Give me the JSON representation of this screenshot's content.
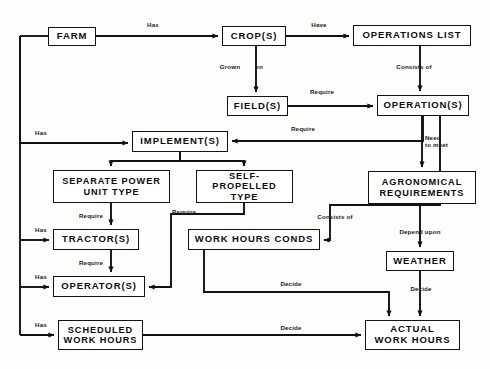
{
  "diagram": {
    "stroke_color": "#121212",
    "background_color": "#fdfdfc",
    "nodes": [
      {
        "id": "farm",
        "label": "FARM",
        "x": 48,
        "y": 27,
        "w": 48,
        "h": 19,
        "font": 9.5
      },
      {
        "id": "crops",
        "label": "CROP(S)",
        "x": 222,
        "y": 26,
        "w": 64,
        "h": 20,
        "font": 9.5
      },
      {
        "id": "oplist",
        "label": "OPERATIONS LIST",
        "x": 353,
        "y": 25,
        "w": 118,
        "h": 21,
        "font": 9.5
      },
      {
        "id": "fields",
        "label": "FIELD(S)",
        "x": 227,
        "y": 96,
        "w": 61,
        "h": 20,
        "font": 9.5
      },
      {
        "id": "operations",
        "label": "OPERATION(S)",
        "x": 377,
        "y": 95,
        "w": 92,
        "h": 21,
        "font": 9.5
      },
      {
        "id": "implements",
        "label": "IMPLEMENT(S)",
        "x": 132,
        "y": 131,
        "w": 96,
        "h": 21,
        "font": 9.5
      },
      {
        "id": "separate",
        "label": "SEPARATE POWER\nUNIT TYPE",
        "x": 53,
        "y": 170,
        "w": 117,
        "h": 33,
        "font": 9.2
      },
      {
        "id": "selfprop",
        "label": "SELF-PROPELLED\nTYPE",
        "x": 196,
        "y": 170,
        "w": 97,
        "h": 33,
        "font": 9.2
      },
      {
        "id": "agronomical",
        "label": "AGRONOMICAL\nREQUIREMENTS",
        "x": 368,
        "y": 171,
        "w": 108,
        "h": 33,
        "font": 9.2
      },
      {
        "id": "tractors",
        "label": "TRACTOR(S)",
        "x": 53,
        "y": 229,
        "w": 86,
        "h": 21,
        "font": 9.5
      },
      {
        "id": "workcond",
        "label": "WORK HOURS CONDS",
        "x": 188,
        "y": 229,
        "w": 132,
        "h": 21,
        "font": 9.5
      },
      {
        "id": "weather",
        "label": "WEATHER",
        "x": 386,
        "y": 251,
        "w": 68,
        "h": 20,
        "font": 9.5
      },
      {
        "id": "operators",
        "label": "OPERATOR(S)",
        "x": 53,
        "y": 276,
        "w": 92,
        "h": 21,
        "font": 9.5
      },
      {
        "id": "scheduled",
        "label": "SCHEDULED\nWORK HOURS",
        "x": 58,
        "y": 320,
        "w": 85,
        "h": 30,
        "font": 9.2
      },
      {
        "id": "actual",
        "label": "ACTUAL\nWORK HOURS",
        "x": 365,
        "y": 320,
        "w": 95,
        "h": 30,
        "font": 9.5
      }
    ],
    "edges": [
      {
        "id": "farm-crops",
        "from": "FARM",
        "to": "CROP(S)",
        "label": "Has"
      },
      {
        "id": "crops-oplist",
        "from": "CROP(S)",
        "to": "OPERATIONS LIST",
        "label": "Have"
      },
      {
        "id": "crops-fields",
        "from": "CROP(S)",
        "to": "FIELD(S)",
        "label": "Grown  on"
      },
      {
        "id": "oplist-operations",
        "from": "OPERATIONS LIST",
        "to": "OPERATION(S)",
        "label": "Consists of"
      },
      {
        "id": "fields-operations",
        "from": "FIELD(S)",
        "to": "OPERATION(S)",
        "label": "Require"
      },
      {
        "id": "operations-implements",
        "from": "OPERATION(S)",
        "to": "IMPLEMENT(S)",
        "label": "Require"
      },
      {
        "id": "farm-implements",
        "from": "FARM",
        "to": "IMPLEMENT(S)",
        "label": "Has"
      },
      {
        "id": "operations-agronomical",
        "from": "OPERATION(S)",
        "to": "AGRONOMICAL REQUIREMENTS",
        "label": "Need\nto meet"
      },
      {
        "id": "separate-tractors",
        "from": "SEPARATE POWER UNIT TYPE",
        "to": "TRACTOR(S)",
        "label": "Require"
      },
      {
        "id": "selfprop-operators",
        "from": "SELF-PROPELLED TYPE",
        "to": "OPERATOR(S)",
        "label": "Require"
      },
      {
        "id": "farm-tractors",
        "from": "FARM",
        "to": "TRACTOR(S)",
        "label": "Has"
      },
      {
        "id": "tractors-operators",
        "from": "TRACTOR(S)",
        "to": "OPERATOR(S)",
        "label": "Require"
      },
      {
        "id": "farm-operators",
        "from": "FARM",
        "to": "OPERATOR(S)",
        "label": "Has"
      },
      {
        "id": "operations-workcond",
        "from": "OPERATION(S)",
        "to": "WORK HOURS CONDS",
        "label": "Consists of"
      },
      {
        "id": "agronomical-weather",
        "from": "AGRONOMICAL REQUIREMENTS",
        "to": "WEATHER",
        "label": "Depend upon"
      },
      {
        "id": "weather-actual",
        "from": "WEATHER",
        "to": "ACTUAL WORK HOURS",
        "label": "Decide"
      },
      {
        "id": "workcond-actual",
        "from": "WORK HOURS CONDS",
        "to": "ACTUAL WORK HOURS",
        "label": "Decide"
      },
      {
        "id": "farm-scheduled",
        "from": "FARM",
        "to": "SCHEDULED WORK HOURS",
        "label": "Has"
      },
      {
        "id": "scheduled-actual",
        "from": "SCHEDULED WORK HOURS",
        "to": "ACTUAL WORK HOURS",
        "label": "Decide"
      }
    ],
    "edge_labels": [
      {
        "id": "lbl-has-crops",
        "text": "Has",
        "x": 141,
        "y": 21,
        "w": 24
      },
      {
        "id": "lbl-have",
        "text": "Have",
        "x": 306,
        "y": 21,
        "w": 26
      },
      {
        "id": "lbl-grown",
        "text": "Grown",
        "x": 216,
        "y": 63,
        "w": 28
      },
      {
        "id": "lbl-on",
        "text": "on",
        "x": 251,
        "y": 63,
        "w": 16
      },
      {
        "id": "lbl-consists-top",
        "text": "Consists of",
        "x": 392,
        "y": 63,
        "w": 44
      },
      {
        "id": "lbl-require-fields",
        "text": "Require",
        "x": 305,
        "y": 88,
        "w": 34
      },
      {
        "id": "lbl-require-impl",
        "text": "Require",
        "x": 286,
        "y": 125,
        "w": 34
      },
      {
        "id": "lbl-has-impl",
        "text": "Has",
        "x": 30,
        "y": 129,
        "w": 22
      },
      {
        "id": "lbl-need-meet",
        "text": "Need\nto meet",
        "x": 425,
        "y": 134,
        "w": 34
      },
      {
        "id": "lbl-require-tr",
        "text": "Require",
        "x": 74,
        "y": 212,
        "w": 34
      },
      {
        "id": "lbl-require-self",
        "text": "Require",
        "x": 167,
        "y": 208,
        "w": 34
      },
      {
        "id": "lbl-consists-cond",
        "text": "Consists of",
        "x": 313,
        "y": 213,
        "w": 44
      },
      {
        "id": "lbl-has-tractor",
        "text": "Has",
        "x": 30,
        "y": 226,
        "w": 22
      },
      {
        "id": "lbl-depend",
        "text": "Depend upon",
        "x": 394,
        "y": 228,
        "w": 52
      },
      {
        "id": "lbl-require-op",
        "text": "Require",
        "x": 74,
        "y": 259,
        "w": 34
      },
      {
        "id": "lbl-has-operator",
        "text": "Has",
        "x": 30,
        "y": 273,
        "w": 22
      },
      {
        "id": "lbl-decide-cond",
        "text": "Decide",
        "x": 276,
        "y": 280,
        "w": 30
      },
      {
        "id": "lbl-decide-weather",
        "text": "Decide",
        "x": 406,
        "y": 285,
        "w": 30
      },
      {
        "id": "lbl-has-sched",
        "text": "Has",
        "x": 30,
        "y": 321,
        "w": 22
      },
      {
        "id": "lbl-decide-sched",
        "text": "Decide",
        "x": 276,
        "y": 324,
        "w": 30
      }
    ]
  }
}
